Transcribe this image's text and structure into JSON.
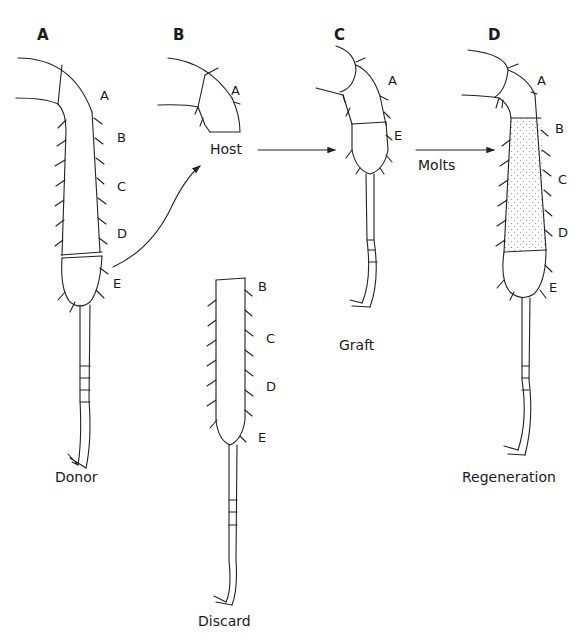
{
  "figure": {
    "panels": [
      {
        "id": "A",
        "caption": "Donor",
        "segments": [
          "A",
          "B",
          "C",
          "D",
          "E"
        ]
      },
      {
        "id": "B",
        "caption": "Host",
        "segments": [
          "A"
        ],
        "discard": {
          "caption": "Discard",
          "segments": [
            "B",
            "C",
            "D",
            "E"
          ]
        }
      },
      {
        "id": "C",
        "caption": "Graft",
        "segments": [
          "A",
          "E"
        ]
      },
      {
        "id": "D",
        "caption": "Regeneration",
        "segments": [
          "A",
          "B",
          "C",
          "D",
          "E"
        ]
      }
    ],
    "arrows": [
      {
        "from": "A",
        "to": "B",
        "label": ""
      },
      {
        "from": "B",
        "to": "C",
        "label": ""
      },
      {
        "from": "C",
        "to": "D",
        "label": "Molts"
      }
    ],
    "colors": {
      "line": "#222222",
      "text": "#1a1a1a",
      "stipple": "#888888",
      "background": "#ffffff"
    }
  }
}
